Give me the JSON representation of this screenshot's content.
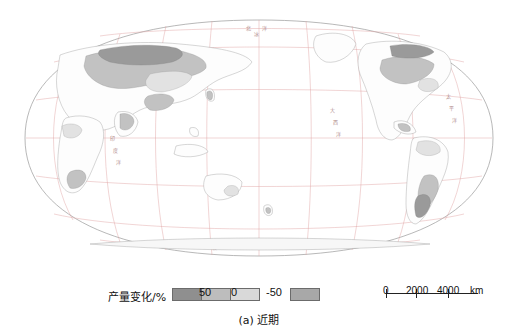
{
  "figure": {
    "caption": "(a) 近期",
    "type": "world-map-thematic"
  },
  "legend": {
    "title": "产量变化/%",
    "ticks": [
      "50",
      "0",
      "-50"
    ],
    "classes": [
      {
        "name": "class-dark",
        "color": "#8f8f8f"
      },
      {
        "name": "class-mid",
        "color": "#bdbdbd"
      },
      {
        "name": "class-light",
        "color": "#d9d9d9"
      },
      {
        "name": "class-negative",
        "color": "#a8a8a8"
      }
    ]
  },
  "scalebar": {
    "values": [
      "0",
      "2000",
      "4000"
    ],
    "unit": "km"
  },
  "map": {
    "projection": "Robinson",
    "graticule_color": "#e0a0a0",
    "labels": [
      "北冰洋",
      "大西洋",
      "太平洋",
      "印度洋",
      "南极洲"
    ]
  }
}
